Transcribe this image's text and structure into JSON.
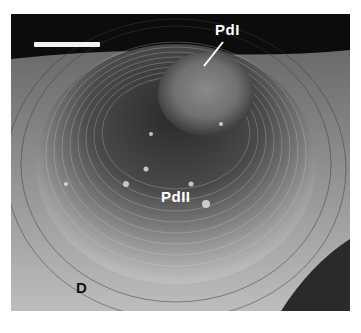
{
  "figure": {
    "type": "SEM micrograph",
    "labels": {
      "pd1": "PdI",
      "pd2": "PdII",
      "d": "D"
    },
    "scale_bar": {
      "present": true,
      "unit_label": ""
    },
    "colors": {
      "background": "#0c0c0c",
      "label_light": "#ffffff",
      "label_dark": "#111111"
    }
  }
}
